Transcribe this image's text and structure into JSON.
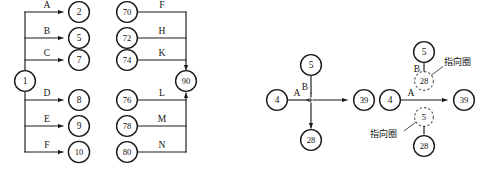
{
  "figure": {
    "title": "",
    "background": "#ffffff",
    "ink": "#1a1a1a",
    "dashed_ink": "#555555"
  },
  "diagrams": [
    {
      "id": "left-fanout-fanin",
      "name": "fan-out-fan-in-diagram",
      "source_node": {
        "label": "1"
      },
      "sink_node": {
        "label": "90"
      },
      "fanout_branches": [
        {
          "edge_label": "A",
          "target": "2"
        },
        {
          "edge_label": "B",
          "target": "5"
        },
        {
          "edge_label": "C",
          "target": "7"
        },
        {
          "edge_label": "D",
          "target": "8"
        },
        {
          "edge_label": "E",
          "target": "9"
        },
        {
          "edge_label": "F",
          "target": "10"
        }
      ],
      "fanin_branches": [
        {
          "source": "70",
          "edge_label": "F"
        },
        {
          "source": "72",
          "edge_label": "H"
        },
        {
          "source": "74",
          "edge_label": "K"
        },
        {
          "source": "76",
          "edge_label": "L"
        },
        {
          "source": "78",
          "edge_label": "M"
        },
        {
          "source": "80",
          "edge_label": "N"
        }
      ]
    },
    {
      "id": "middle-crossing",
      "name": "crossing-junction-diagram",
      "nodes": {
        "left": "4",
        "top": "5",
        "right": "39",
        "bottom": "28"
      },
      "edge_labels": {
        "horizontal": "A",
        "vertical": "B"
      }
    },
    {
      "id": "right-pointing-circles",
      "name": "pointing-circle-diagram",
      "nodes": {
        "left": "4",
        "top": "5",
        "right": "39",
        "bottom": "28"
      },
      "dashed_nodes": {
        "upper": "28",
        "lower": "5"
      },
      "edge_labels": {
        "horizontal": "A",
        "vertical": "B"
      },
      "annotations": [
        {
          "text": "指向圈",
          "target": "upper-dashed-circle"
        },
        {
          "text": "指向圈",
          "target": "lower-dashed-circle"
        }
      ]
    }
  ]
}
